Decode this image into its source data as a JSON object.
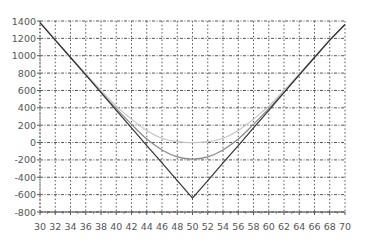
{
  "chart_data": {
    "type": "line",
    "title": "",
    "xlabel": "",
    "ylabel": "",
    "xlim": [
      30,
      70
    ],
    "ylim": [
      -800,
      1400
    ],
    "x_ticks": [
      30,
      32,
      34,
      36,
      38,
      40,
      42,
      44,
      46,
      48,
      50,
      52,
      54,
      56,
      58,
      60,
      62,
      64,
      66,
      68,
      70
    ],
    "y_ticks": [
      1400,
      1200,
      1000,
      800,
      600,
      400,
      200,
      0,
      -200,
      -400,
      -600,
      -800
    ],
    "grid": true,
    "legend": null,
    "x": [
      30,
      32,
      34,
      36,
      38,
      40,
      42,
      44,
      46,
      48,
      50,
      52,
      54,
      56,
      58,
      60,
      62,
      64,
      66,
      68,
      70
    ],
    "series": [
      {
        "name": "payoff-at-expiry",
        "color": "#333333",
        "values": [
          1380,
          1180,
          980,
          780,
          575,
          370,
          170,
          -35,
          -235,
          -440,
          -640,
          -440,
          -235,
          -35,
          170,
          370,
          575,
          780,
          980,
          1180,
          1360
        ]
      },
      {
        "name": "value-mid",
        "color": "#8a8a8a",
        "values": [
          1380,
          1180,
          980,
          780,
          580,
          390,
          210,
          40,
          -85,
          -165,
          -190,
          -165,
          -85,
          40,
          210,
          390,
          580,
          780,
          980,
          1180,
          1360
        ]
      },
      {
        "name": "value-early",
        "color": "#c4c4c4",
        "values": [
          1380,
          1180,
          985,
          790,
          600,
          420,
          270,
          140,
          50,
          10,
          0,
          10,
          50,
          140,
          270,
          420,
          600,
          790,
          985,
          1180,
          1360
        ]
      }
    ]
  }
}
